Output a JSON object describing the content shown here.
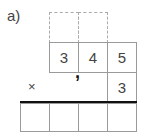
{
  "exercise": {
    "label": "a)",
    "multiplicand_digits": [
      "3",
      "4",
      "5"
    ],
    "operator": "×",
    "multiplier_digits": [
      "3"
    ],
    "decimal_separator": ",",
    "result_cells": [
      "",
      "",
      "",
      ""
    ],
    "carry_cells": [
      "",
      ""
    ]
  }
}
